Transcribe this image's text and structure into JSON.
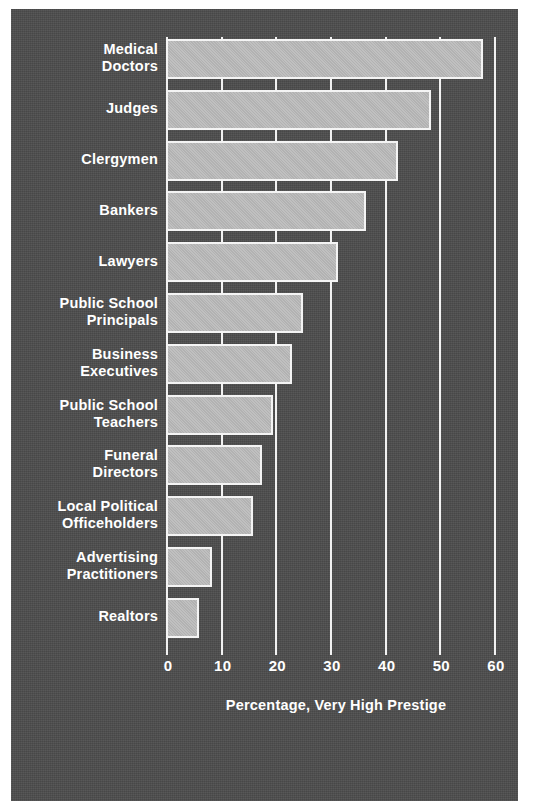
{
  "chart_data": {
    "type": "bar",
    "orientation": "horizontal",
    "title": "",
    "subtitle": "",
    "xlabel": "Percentage, Very High Prestige",
    "ylabel": "",
    "xlim": [
      0,
      60
    ],
    "xticks": [
      0,
      10,
      20,
      30,
      40,
      50,
      60
    ],
    "xtick_labels": [
      "0",
      "10",
      "20",
      "30",
      "40",
      "50",
      "60"
    ],
    "grid": true,
    "grid_axis": "x",
    "legend": false,
    "legend_position": "none",
    "categories": [
      "Medical Doctors",
      "Judges",
      "Clergymen",
      "Bankers",
      "Lawyers",
      "Public School Principals",
      "Business Executives",
      "Public School Teachers",
      "Funeral Directors",
      "Local Political Officeholders",
      "Advertising Practitioners",
      "Realtors"
    ],
    "category_lines": [
      [
        "Medical",
        "Doctors"
      ],
      [
        "Judges"
      ],
      [
        "Clergymen"
      ],
      [
        "Bankers"
      ],
      [
        "Lawyers"
      ],
      [
        "Public School",
        "Principals"
      ],
      [
        "Business",
        "Executives"
      ],
      [
        "Public School",
        "Teachers"
      ],
      [
        "Funeral",
        "Directors"
      ],
      [
        "Local Political",
        "Officeholders"
      ],
      [
        "Advertising",
        "Practitioners"
      ],
      [
        "Realtors"
      ]
    ],
    "values": [
      58,
      48.5,
      42.5,
      36.5,
      31.5,
      25,
      23,
      19.5,
      17.5,
      16,
      8.5,
      6
    ],
    "colors": {
      "background": "#4c4c4c",
      "bar_fill": "#b9b9b9",
      "bar_outline": "#f4f4f4",
      "text": "#ffffff",
      "gridline": "#f2f2f2",
      "page": "#ffffff"
    }
  }
}
